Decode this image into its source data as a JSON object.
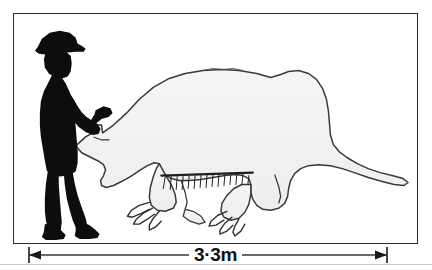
{
  "figure": {
    "caption_alt": "Size comparison of a giant ground sloth silhouette with a standing man",
    "frame_border_color": "#2b2b2b",
    "background_color": "#ffffff"
  },
  "scale": {
    "label": "3·3m",
    "value": 3.3,
    "unit": "m",
    "left_tick": "|",
    "right_tick": "|",
    "arrow_left": "left-arrowhead",
    "arrow_right": "right-arrowhead"
  },
  "subjects": [
    {
      "id": "human-silhouette",
      "name": "man-silhouette",
      "description": "Standing man in hat holding a tool, filled solid black",
      "fill_color": "#0d0d0d",
      "height_fraction": 0.86
    },
    {
      "id": "animal-outline",
      "name": "giant-ground-sloth-outline",
      "description": "Large quadruped with humped back, long tail, heavy claws and a belly fringe of hair",
      "fill_color": "#f2f2f2",
      "stroke_color": "#3a3a3a",
      "length_m": 3.3
    }
  ],
  "icons": {
    "hat": "hat-icon",
    "hammer": "hammer-icon",
    "claw": "claw-icon",
    "fringe": "fur-fringe-icon",
    "left_arrow": "arrow-left-icon",
    "right_arrow": "arrow-right-icon"
  }
}
